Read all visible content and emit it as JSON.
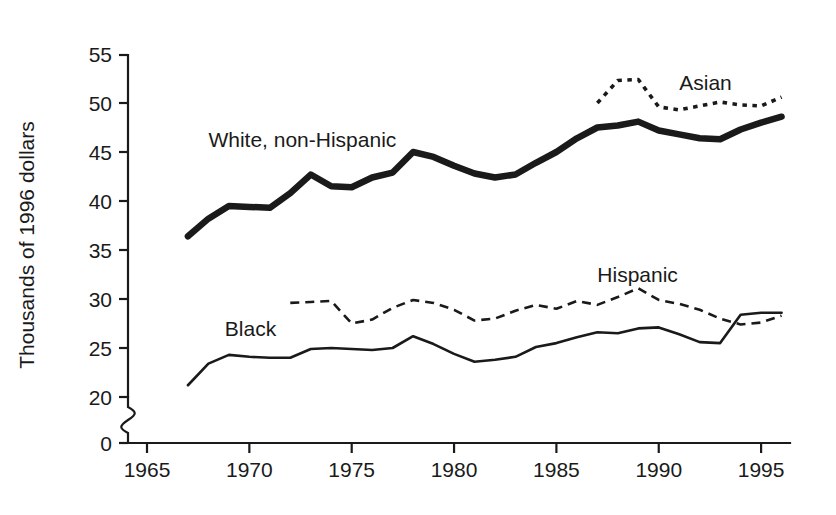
{
  "chart_data": {
    "type": "line",
    "title": "",
    "subtitle": "",
    "xlabel": "",
    "ylabel": "Thousands of 1996 dollars",
    "xlim": [
      1965,
      1996.5
    ],
    "ylim": [
      20,
      55
    ],
    "y_axis_break": true,
    "y_axis_zero_label": "0",
    "grid": false,
    "legend_position": "inline-annotations",
    "x_ticks": [
      1965,
      1970,
      1975,
      1980,
      1985,
      1990,
      1995
    ],
    "x_tick_labels": [
      "1965",
      "1970",
      "1975",
      "1980",
      "1985",
      "1990",
      "1995"
    ],
    "y_ticks": [
      0,
      20,
      25,
      30,
      35,
      40,
      45,
      50,
      55
    ],
    "y_tick_labels": [
      "0",
      "20",
      "25",
      "30",
      "35",
      "40",
      "45",
      "50",
      "55"
    ],
    "series": [
      {
        "name": "White, non-Hispanic",
        "label": "White, non-Hispanic",
        "style": "solid-thick",
        "label_x": 1968.0,
        "label_y": 46.2,
        "x": [
          1967,
          1968,
          1969,
          1970,
          1971,
          1972,
          1973,
          1974,
          1975,
          1976,
          1977,
          1978,
          1979,
          1980,
          1981,
          1982,
          1983,
          1984,
          1985,
          1986,
          1987,
          1988,
          1989,
          1990,
          1991,
          1992,
          1993,
          1994,
          1995,
          1996
        ],
        "values": [
          36.4,
          38.2,
          39.5,
          39.4,
          39.3,
          40.8,
          42.7,
          41.5,
          41.4,
          42.4,
          42.9,
          45.0,
          44.5,
          43.6,
          42.8,
          42.4,
          42.7,
          43.9,
          45.0,
          46.4,
          47.5,
          47.7,
          48.1,
          47.2,
          46.8,
          46.4,
          46.3,
          47.3,
          48.0,
          48.6
        ]
      },
      {
        "name": "Asian",
        "label": "Asian",
        "style": "dotted",
        "label_x": 1991.0,
        "label_y": 52.0,
        "x": [
          1987,
          1988,
          1989,
          1990,
          1991,
          1992,
          1993,
          1994,
          1995,
          1996
        ],
        "values": [
          50.0,
          52.3,
          52.4,
          49.6,
          49.3,
          49.7,
          50.1,
          49.8,
          49.7,
          50.6
        ]
      },
      {
        "name": "Hispanic",
        "label": "Hispanic",
        "style": "dashed",
        "label_x": 1987.0,
        "label_y": 32.4,
        "x": [
          1972,
          1973,
          1974,
          1975,
          1976,
          1977,
          1978,
          1979,
          1980,
          1981,
          1982,
          1983,
          1984,
          1985,
          1986,
          1987,
          1988,
          1989,
          1990,
          1991,
          1992,
          1993,
          1994,
          1995,
          1996
        ],
        "values": [
          29.6,
          29.7,
          29.8,
          27.5,
          27.9,
          29.1,
          29.9,
          29.6,
          28.9,
          27.8,
          28.0,
          28.8,
          29.4,
          29.0,
          29.8,
          29.4,
          30.2,
          31.1,
          29.9,
          29.5,
          28.9,
          28.0,
          27.4,
          27.6,
          28.3
        ]
      },
      {
        "name": "Black",
        "label": "Black",
        "style": "solid-thin",
        "label_x": 1968.8,
        "label_y": 26.9,
        "x": [
          1967,
          1968,
          1969,
          1970,
          1971,
          1972,
          1973,
          1974,
          1975,
          1976,
          1977,
          1978,
          1979,
          1980,
          1981,
          1982,
          1983,
          1984,
          1985,
          1986,
          1987,
          1988,
          1989,
          1990,
          1991,
          1992,
          1993,
          1994,
          1995,
          1996
        ],
        "values": [
          21.2,
          23.4,
          24.3,
          24.1,
          24.0,
          24.0,
          24.9,
          25.0,
          24.9,
          24.8,
          25.0,
          26.2,
          25.4,
          24.4,
          23.6,
          23.8,
          24.1,
          25.1,
          25.5,
          26.1,
          26.6,
          26.5,
          27.0,
          27.1,
          26.4,
          25.6,
          25.5,
          28.4,
          28.6,
          28.6
        ]
      }
    ]
  },
  "colors": {
    "line": "#1a1a1a",
    "background": "#ffffff",
    "axis": "#1a1a1a"
  }
}
